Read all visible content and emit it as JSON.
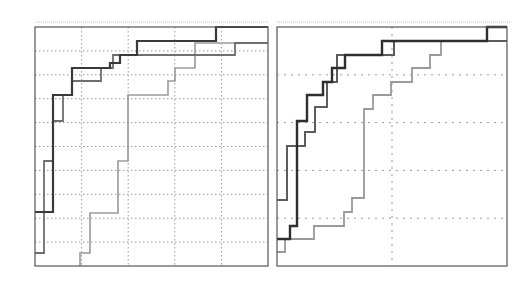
{
  "chart_data": [
    {
      "type": "line",
      "subtype": "step (empirical CDF)",
      "title": "",
      "xlabel": "",
      "ylabel": "",
      "xlim": [
        0,
        5
      ],
      "ylim": [
        0,
        1
      ],
      "grid": true,
      "grid_x_ticks": [
        0,
        1,
        2,
        3,
        4,
        5
      ],
      "grid_y_ticks": [
        0,
        0.1,
        0.2,
        0.3,
        0.4,
        0.5,
        0.6,
        0.7,
        0.8,
        0.9,
        1.0
      ],
      "legend": "none",
      "frame": {
        "x0": 35,
        "x1": 268,
        "y0": 27,
        "y1": 266
      },
      "series": [
        {
          "name": "series-dark",
          "color": "#3a3a3a",
          "width": 2.2,
          "points": [
            [
              35,
              212
            ],
            [
              53,
              212
            ],
            [
              53,
              95
            ],
            [
              72,
              95
            ],
            [
              72,
              68
            ],
            [
              110,
              68
            ],
            [
              110,
              63
            ],
            [
              120,
              63
            ],
            [
              120,
              55
            ],
            [
              137,
              55
            ],
            [
              137,
              41
            ],
            [
              216,
              41
            ],
            [
              216,
              27
            ],
            [
              268,
              27
            ]
          ]
        },
        {
          "name": "series-medium",
          "color": "#6e6e6e",
          "width": 1.8,
          "points": [
            [
              35,
              253
            ],
            [
              44,
              253
            ],
            [
              44,
              161
            ],
            [
              53,
              161
            ],
            [
              53,
              121
            ],
            [
              63,
              121
            ],
            [
              63,
              95
            ],
            [
              72,
              95
            ],
            [
              72,
              81
            ],
            [
              101,
              81
            ],
            [
              101,
              68
            ],
            [
              113,
              68
            ],
            [
              113,
              55
            ],
            [
              235,
              55
            ],
            [
              235,
              43
            ],
            [
              268,
              43
            ]
          ]
        },
        {
          "name": "series-light",
          "color": "#9a9a9a",
          "width": 1.6,
          "points": [
            [
              80,
              266
            ],
            [
              80,
              253
            ],
            [
              90,
              253
            ],
            [
              90,
              213
            ],
            [
              118,
              213
            ],
            [
              118,
              161
            ],
            [
              128,
              161
            ],
            [
              128,
              95
            ],
            [
              168,
              95
            ],
            [
              168,
              81
            ],
            [
              175,
              81
            ],
            [
              175,
              68
            ],
            [
              195,
              68
            ],
            [
              195,
              43
            ],
            [
              268,
              43
            ]
          ]
        }
      ]
    },
    {
      "type": "line",
      "subtype": "step (empirical CDF)",
      "title": "",
      "xlabel": "",
      "ylabel": "",
      "xlim": [
        0,
        2
      ],
      "ylim": [
        0,
        1
      ],
      "grid": true,
      "grid_x_ticks": [
        0,
        1,
        2
      ],
      "grid_y_ticks": [
        0,
        0.2,
        0.4,
        0.6,
        0.8,
        1.0
      ],
      "legend": "none",
      "frame": {
        "x0": 277,
        "x1": 507,
        "y0": 27,
        "y1": 266
      },
      "series": [
        {
          "name": "series-dark",
          "color": "#2e2e2e",
          "width": 2.4,
          "points": [
            [
              277,
              239
            ],
            [
              290,
              239
            ],
            [
              290,
              226
            ],
            [
              297,
              226
            ],
            [
              297,
              121
            ],
            [
              307,
              121
            ],
            [
              307,
              95
            ],
            [
              323,
              95
            ],
            [
              323,
              82
            ],
            [
              332,
              82
            ],
            [
              332,
              68
            ],
            [
              345,
              68
            ],
            [
              345,
              55
            ],
            [
              382,
              55
            ],
            [
              382,
              41
            ],
            [
              487,
              41
            ],
            [
              487,
              27
            ],
            [
              507,
              27
            ]
          ]
        },
        {
          "name": "series-medium",
          "color": "#5c5c5c",
          "width": 2.0,
          "points": [
            [
              277,
              200
            ],
            [
              287,
              200
            ],
            [
              287,
              146
            ],
            [
              305,
              146
            ],
            [
              305,
              132
            ],
            [
              315,
              132
            ],
            [
              315,
              107
            ],
            [
              327,
              107
            ],
            [
              327,
              82
            ],
            [
              337,
              82
            ],
            [
              337,
              55
            ],
            [
              394,
              55
            ],
            [
              394,
              41
            ],
            [
              507,
              41
            ]
          ]
        },
        {
          "name": "series-light",
          "color": "#9a9a9a",
          "width": 1.8,
          "points": [
            [
              277,
              252
            ],
            [
              285,
              252
            ],
            [
              285,
              239
            ],
            [
              314,
              239
            ],
            [
              314,
              226
            ],
            [
              344,
              226
            ],
            [
              344,
              212
            ],
            [
              352,
              212
            ],
            [
              352,
              198
            ],
            [
              364,
              198
            ],
            [
              364,
              109
            ],
            [
              373,
              109
            ],
            [
              373,
              95
            ],
            [
              391,
              95
            ],
            [
              391,
              82
            ],
            [
              412,
              82
            ],
            [
              412,
              68
            ],
            [
              430,
              68
            ],
            [
              430,
              55
            ],
            [
              441,
              55
            ],
            [
              441,
              41
            ],
            [
              507,
              41
            ]
          ]
        }
      ]
    }
  ],
  "style": {
    "background": "#ffffff",
    "frame_color": "#555555",
    "grid_color": "#9a9a9a",
    "top_rule_color": "#bdbdbd"
  }
}
